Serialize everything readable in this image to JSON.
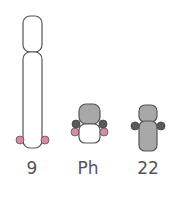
{
  "diagram": {
    "type": "chromosome-translocation",
    "chromosomes": [
      {
        "id": "chr9",
        "label": "9"
      },
      {
        "id": "ph",
        "label": "Ph"
      },
      {
        "id": "chr22",
        "label": "22"
      }
    ],
    "colors": {
      "outline": "#555555",
      "light_fill": "#ffffff",
      "gray_fill": "#a8a8a8",
      "dark_knob": "#5a5a5a",
      "pink_knob": "#d98a9c"
    }
  }
}
